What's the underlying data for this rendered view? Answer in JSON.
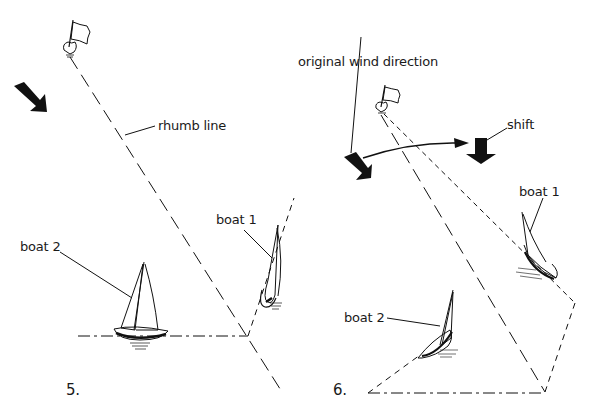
{
  "figure5": {
    "number": "5.",
    "labels": {
      "rhumb_line": "rhumb line",
      "boat1": "boat 1",
      "boat2": "boat 2"
    },
    "icons": [
      "mark-flag-icon",
      "wind-arrow-icon",
      "sailboat-icon"
    ]
  },
  "figure6": {
    "number": "6.",
    "labels": {
      "original_wind": "original wind direction",
      "shift": "shift",
      "boat1": "boat 1",
      "boat2": "boat 2"
    },
    "icons": [
      "mark-flag-icon",
      "wind-arrow-icon",
      "shifted-wind-arrow-icon",
      "curved-arrow-icon",
      "sailboat-icon"
    ]
  },
  "colors": {
    "ink": "#111111",
    "background": "#ffffff"
  }
}
